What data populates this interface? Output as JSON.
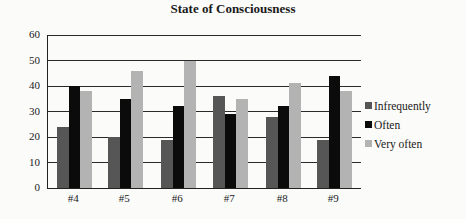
{
  "chart_data": {
    "type": "bar",
    "title": "State of Consciousness",
    "xlabel": "",
    "ylabel": "",
    "ylim": [
      0,
      60
    ],
    "yticks": [
      0,
      10,
      20,
      30,
      40,
      50,
      60
    ],
    "grid": true,
    "legend_position": "right",
    "categories": [
      "#4",
      "#5",
      "#6",
      "#7",
      "#8",
      "#9"
    ],
    "series": [
      {
        "name": "Infrequently",
        "color": "#565656",
        "values": [
          24,
          20,
          19,
          36,
          28,
          19
        ]
      },
      {
        "name": "Often",
        "color": "#0b0b0b",
        "values": [
          40,
          35,
          32,
          29,
          32,
          44
        ]
      },
      {
        "name": "Very often",
        "color": "#b3b3b3",
        "values": [
          38,
          46,
          50,
          35,
          41,
          38
        ]
      }
    ]
  },
  "title": "State of Consciousness",
  "y_tick_labels": [
    "0",
    "10",
    "20",
    "30",
    "40",
    "50",
    "60"
  ],
  "x_tick_labels": [
    "#4",
    "#5",
    "#6",
    "#7",
    "#8",
    "#9"
  ],
  "legend": [
    {
      "label": "Infrequently",
      "color": "#565656"
    },
    {
      "label": "Often",
      "color": "#0b0b0b"
    },
    {
      "label": "Very often",
      "color": "#b3b3b3"
    }
  ]
}
